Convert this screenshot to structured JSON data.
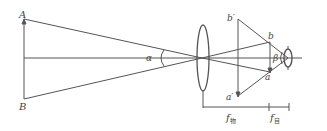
{
  "diagram": {
    "type": "optics-angular-magnification",
    "labels": {
      "A": "A",
      "B": "B",
      "alpha": "α",
      "b_prime": "b′",
      "a_prime": "a′",
      "b": "b",
      "a": "a",
      "beta": "β",
      "f_obj": "f",
      "f_obj_sub": "物",
      "f_eye": "f",
      "f_eye_sub": "目"
    },
    "colors": {
      "line": "#555555",
      "text": "#444444",
      "background": "#ffffff"
    }
  }
}
